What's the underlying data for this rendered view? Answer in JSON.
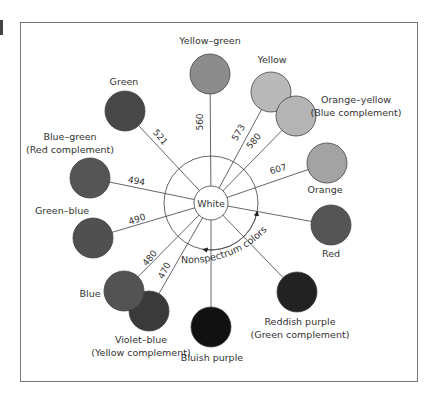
{
  "center": {
    "label": "White",
    "x": 211,
    "y": 203,
    "inner_radius": 17,
    "outer_radius": 47
  },
  "nonspectrum": {
    "label": "Nonspectrum colors"
  },
  "colors": [
    {
      "id": "yellow-green",
      "label": [
        "Yellow–green"
      ],
      "wavelength": "560",
      "x": 210,
      "y": 74,
      "fill": "#8c8c8c",
      "label_x": 210,
      "label_y": 44,
      "anchor": "middle"
    },
    {
      "id": "yellow",
      "label": [
        "Yellow"
      ],
      "wavelength": "573",
      "x": 271,
      "y": 92,
      "fill": "#b9b9b9",
      "label_x": 272,
      "label_y": 63,
      "anchor": "middle"
    },
    {
      "id": "orange-yellow",
      "label": [
        "Orange–yellow",
        "(Blue complement)"
      ],
      "wavelength": "580",
      "x": 296,
      "y": 116,
      "fill": "#b4b4b4",
      "label_x": 356,
      "label_y": 103,
      "anchor": "middle"
    },
    {
      "id": "orange",
      "label": [
        "Orange"
      ],
      "wavelength": "607",
      "x": 327,
      "y": 163,
      "fill": "#a3a3a3",
      "label_x": 325,
      "label_y": 193,
      "anchor": "middle"
    },
    {
      "id": "red",
      "label": [
        "Red"
      ],
      "wavelength": "",
      "x": 331,
      "y": 225,
      "fill": "#555555",
      "label_x": 331,
      "label_y": 257,
      "anchor": "middle"
    },
    {
      "id": "reddish-purple",
      "label": [
        "Reddish purple",
        "(Green complement)"
      ],
      "wavelength": "",
      "x": 297,
      "y": 292,
      "fill": "#222222",
      "label_x": 300,
      "label_y": 325,
      "anchor": "middle"
    },
    {
      "id": "bluish-purple",
      "label": [
        "Bluish purple"
      ],
      "wavelength": "",
      "x": 211,
      "y": 327,
      "fill": "#111111",
      "label_x": 212,
      "label_y": 361,
      "anchor": "middle"
    },
    {
      "id": "violet-blue",
      "label": [
        "Violet–blue",
        "(Yellow complement)"
      ],
      "wavelength": "470",
      "x": 149,
      "y": 311,
      "fill": "#3a3a3a",
      "label_x": 141,
      "label_y": 343,
      "anchor": "middle"
    },
    {
      "id": "blue",
      "label": [
        "Blue"
      ],
      "wavelength": "480",
      "x": 124,
      "y": 291,
      "fill": "#535353",
      "label_x": 90,
      "label_y": 297,
      "anchor": "middle"
    },
    {
      "id": "green-blue",
      "label": [
        "Green–blue"
      ],
      "wavelength": "490",
      "x": 93,
      "y": 238,
      "fill": "#505050",
      "label_x": 62,
      "label_y": 214,
      "anchor": "middle"
    },
    {
      "id": "blue-green",
      "label": [
        "Blue–green",
        "(Red complement)"
      ],
      "wavelength": "494",
      "x": 90,
      "y": 178,
      "fill": "#555555",
      "label_x": 70,
      "label_y": 140,
      "anchor": "middle"
    },
    {
      "id": "green",
      "label": [
        "Green"
      ],
      "wavelength": "521",
      "x": 125,
      "y": 111,
      "fill": "#474747",
      "label_x": 124,
      "label_y": 85,
      "anchor": "middle"
    }
  ],
  "wavelength_labels": [
    {
      "text": "560",
      "x": 203,
      "y": 122,
      "rotate": -90
    },
    {
      "text": "573",
      "x": 241,
      "y": 134,
      "rotate": -60
    },
    {
      "text": "580",
      "x": 256,
      "y": 143,
      "rotate": -50
    },
    {
      "text": "607",
      "x": 279,
      "y": 172,
      "rotate": -16
    },
    {
      "text": "521",
      "x": 158,
      "y": 139,
      "rotate": 50
    },
    {
      "text": "494",
      "x": 136,
      "y": 184,
      "rotate": 10
    },
    {
      "text": "490",
      "x": 138,
      "y": 222,
      "rotate": -18
    },
    {
      "text": "480",
      "x": 152,
      "y": 260,
      "rotate": -50
    },
    {
      "text": "470",
      "x": 167,
      "y": 272,
      "rotate": -62
    }
  ],
  "circle_radius": 20
}
